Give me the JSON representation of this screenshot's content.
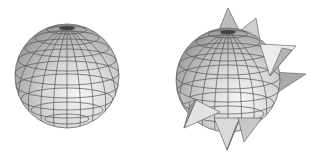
{
  "figure": {
    "colors": {
      "background": "#ffffff",
      "mesh_light": "#eeeeee",
      "mesh_mid": "#cfcfcf",
      "mesh_dark": "#9a9a9a",
      "grid_line": "#555555",
      "spike_light": "#e6e6e6",
      "spike_dark": "#8c8c8c"
    },
    "objects": [
      {
        "name": "plain-sphere",
        "cx": 67,
        "cy": 76,
        "r": 52
      },
      {
        "name": "spiky-sphere",
        "cx": 228,
        "cy": 80,
        "r": 52
      }
    ]
  }
}
